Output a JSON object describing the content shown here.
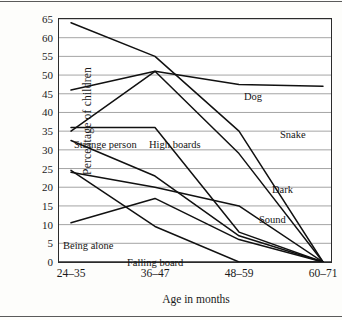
{
  "chart_data": {
    "type": "line",
    "title": "",
    "xlabel": "Age in months",
    "ylabel": "Percentage of children",
    "categories": [
      "24–35",
      "36–47",
      "48–59",
      "60–71"
    ],
    "ylim": [
      0,
      65
    ],
    "ytick_step": 5,
    "yticks": [
      0,
      5,
      10,
      15,
      20,
      25,
      30,
      35,
      40,
      45,
      50,
      55,
      60,
      65
    ],
    "grid": "horizontal",
    "legend_position": "inline-labels",
    "series": [
      {
        "name": "Snake",
        "values": [
          64,
          55,
          35,
          0
        ]
      },
      {
        "name": "Dog",
        "values": [
          46,
          51,
          47.5,
          47
        ]
      },
      {
        "name": "Dark",
        "values": [
          35,
          51,
          29,
          0
        ]
      },
      {
        "name": "High boards",
        "values": [
          36,
          36,
          8,
          0
        ]
      },
      {
        "name": "Strange person",
        "values": [
          32.5,
          23,
          7,
          0
        ]
      },
      {
        "name": "Sound",
        "values": [
          24,
          20,
          15,
          0
        ]
      },
      {
        "name": "Being alone",
        "values": [
          10.5,
          17,
          6,
          0
        ]
      },
      {
        "name": "Falling board",
        "values": [
          24.5,
          9.5,
          0,
          0
        ]
      }
    ],
    "series_labels": [
      {
        "text": "Dog",
        "x": 243,
        "y": 90
      },
      {
        "text": "Snake",
        "x": 279,
        "y": 128
      },
      {
        "text": "Dark",
        "x": 271,
        "y": 183
      },
      {
        "text": "Sound",
        "x": 258,
        "y": 213
      },
      {
        "text": "High boards",
        "x": 148,
        "y": 138
      },
      {
        "text": "Strange person",
        "x": 73,
        "y": 138
      },
      {
        "text": "Being alone",
        "x": 62,
        "y": 239
      },
      {
        "text": "Falling board",
        "x": 126,
        "y": 256
      }
    ],
    "colors": {
      "line": "#111111",
      "grid": "#8d8d8d",
      "axis": "#2b2b2b",
      "background": "#ffffff",
      "text": "#151515"
    }
  }
}
